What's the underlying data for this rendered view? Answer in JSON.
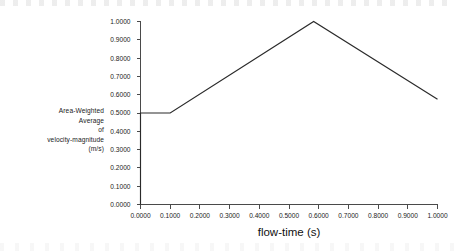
{
  "chart_data": {
    "type": "line",
    "title": "",
    "xlabel": "flow-time (s)",
    "ylabel": "Area-Weighted Average of velocity-magnitude (m/s)",
    "ylabel_lines": [
      "Area-Weighted",
      "Average",
      "of",
      "velocity-magnitude",
      "(m/s)"
    ],
    "xlim": [
      0.0,
      1.0
    ],
    "ylim": [
      0.0,
      1.0
    ],
    "grid": false,
    "legend": false,
    "line_color": "#2a2a2a",
    "axis_color": "#4a4a4a",
    "background_color": "#ffffff",
    "xticks": [
      0.0,
      0.1,
      0.2,
      0.3,
      0.4,
      0.5,
      0.6,
      0.7,
      0.8,
      0.9,
      1.0
    ],
    "xtick_labels": [
      "0.0000",
      "0.1000",
      "0.2000",
      "0.3000",
      "0.4000",
      "0.5000",
      "0.6000",
      "0.7000",
      "0.8000",
      "0.9000",
      "1.0000"
    ],
    "yticks": [
      0.0,
      0.1,
      0.2,
      0.3,
      0.4,
      0.5,
      0.6,
      0.7,
      0.8,
      0.9,
      1.0
    ],
    "ytick_labels": [
      "0.0000",
      "0.1000",
      "0.2000",
      "0.3000",
      "0.4000",
      "0.5000",
      "0.6000",
      "0.7000",
      "0.8000",
      "0.9000",
      "1.0000"
    ],
    "series": [
      {
        "name": "Area-Weighted Average of velocity-magnitude",
        "x": [
          0.0,
          0.0,
          0.1,
          0.583,
          1.0
        ],
        "y": [
          0.0,
          0.5,
          0.5,
          1.0,
          0.575
        ]
      }
    ]
  }
}
